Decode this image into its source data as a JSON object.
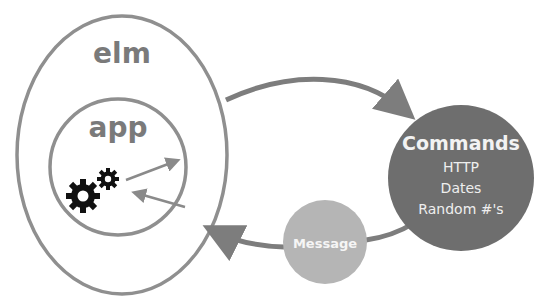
{
  "diagram": {
    "outer_label": "elm",
    "inner_label": "app",
    "commands": {
      "title": "Commands",
      "items": [
        "HTTP",
        "Dates",
        "Random #'s"
      ]
    },
    "message": {
      "label": "Message"
    },
    "colors": {
      "outline": "#8f8f8f",
      "label_gray": "#7a7a7a",
      "commands_fill": "#6e6e6e",
      "message_fill": "#b5b5b5",
      "arrow": "#7d7d7d",
      "gear": "#111111",
      "text_light": "#f2f2f2"
    }
  }
}
